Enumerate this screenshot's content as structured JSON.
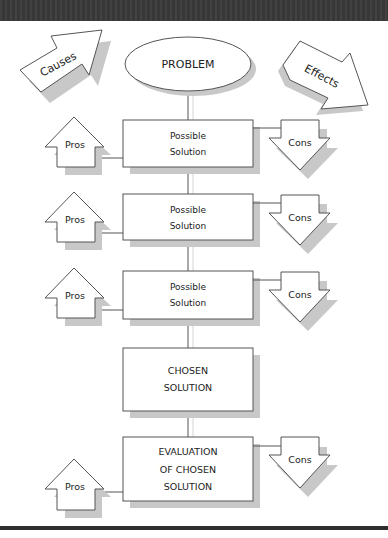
{
  "diagram": {
    "type": "flowchart",
    "colors": {
      "frame_bar": "#3a3a3a",
      "stroke": "#555555",
      "shadow": "#c8c8c8",
      "fill": "#ffffff",
      "text": "#222222"
    },
    "problem": {
      "label": "PROBLEM"
    },
    "causes": {
      "label": "Causes"
    },
    "effects": {
      "label": "Effects"
    },
    "steps": [
      {
        "label_line1": "Possible",
        "label_line2": "Solution",
        "pros": "Pros",
        "cons": "Cons"
      },
      {
        "label_line1": "Possible",
        "label_line2": "Solution",
        "pros": "Pros",
        "cons": "Cons"
      },
      {
        "label_line1": "Possible",
        "label_line2": "Solution",
        "pros": "Pros",
        "cons": "Cons"
      }
    ],
    "chosen": {
      "label_line1": "CHOSEN",
      "label_line2": "SOLUTION"
    },
    "evaluation": {
      "label_line1": "EVALUATION",
      "label_line2": "OF CHOSEN",
      "label_line3": "SOLUTION",
      "pros": "Pros",
      "cons": "Cons"
    }
  }
}
